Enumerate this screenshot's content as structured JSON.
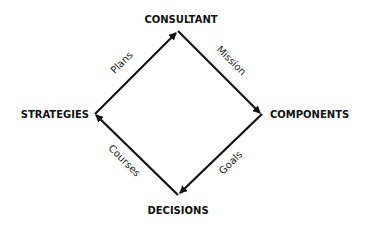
{
  "diagram": {
    "type": "cycle",
    "nodes": {
      "top": "CONSULTANT",
      "right": "COMPONENTS",
      "bottom": "DECISIONS",
      "left": "STRATEGIES"
    },
    "edges": [
      {
        "from": "CONSULTANT",
        "to": "COMPONENTS",
        "label": "Mission"
      },
      {
        "from": "COMPONENTS",
        "to": "DECISIONS",
        "label": "Goals"
      },
      {
        "from": "DECISIONS",
        "to": "STRATEGIES",
        "label": "Courses"
      },
      {
        "from": "STRATEGIES",
        "to": "CONSULTANT",
        "label": "Plans"
      }
    ],
    "colors": {
      "line": "#111111",
      "text": "#111111",
      "background": "#ffffff"
    }
  }
}
